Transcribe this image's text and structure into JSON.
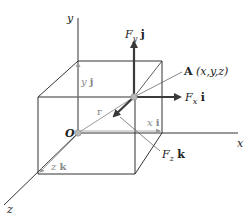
{
  "figure": {
    "axes": {
      "x_label": "x",
      "y_label": "y",
      "z_label": "z"
    },
    "origin_label": "O",
    "point": {
      "name": "A",
      "coords": "(x,y,z)"
    },
    "position_vector_label": "r",
    "components": {
      "x": {
        "scalar": "x",
        "unit": "i"
      },
      "y": {
        "scalar": "y",
        "unit": "j"
      },
      "z": {
        "scalar": "z",
        "unit": "k"
      }
    },
    "forces": {
      "fx": {
        "sym": "F",
        "sub": "x",
        "unit": "i"
      },
      "fy": {
        "sym": "F",
        "sub": "y",
        "unit": "j"
      },
      "fz": {
        "sym": "F",
        "sub": "z",
        "unit": "k"
      }
    },
    "colors": {
      "line": "#333333",
      "vector": "#3a3a3a",
      "guide": "#9a9a9a",
      "point": "#b0b0b0"
    }
  }
}
